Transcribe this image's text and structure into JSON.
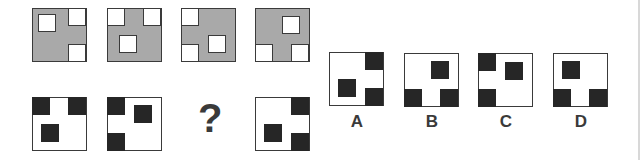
{
  "puzzle": {
    "question_mark": "?",
    "colors": {
      "gray_fill": "#a9a9a9",
      "black_square": "#262626",
      "outline": "#3a3a3a"
    },
    "row1": [
      {
        "left": 32,
        "top": 8,
        "squares": [
          [
            6,
            6
          ],
          [
            36,
            0
          ],
          [
            36,
            36
          ]
        ]
      },
      {
        "left": 107,
        "top": 8,
        "squares": [
          [
            0,
            0
          ],
          [
            36,
            0
          ],
          [
            12,
            27
          ]
        ]
      },
      {
        "left": 181,
        "top": 8,
        "squares": [
          [
            0,
            0
          ],
          [
            0,
            36
          ],
          [
            27,
            27
          ]
        ]
      },
      {
        "left": 255,
        "top": 8,
        "squares": [
          [
            0,
            36
          ],
          [
            36,
            36
          ],
          [
            27,
            8
          ]
        ]
      }
    ],
    "row2": [
      {
        "left": 32,
        "top": 97,
        "squares": [
          [
            0,
            0
          ],
          [
            36,
            0
          ],
          [
            9,
            27
          ]
        ]
      },
      {
        "left": 107,
        "top": 97,
        "squares": [
          [
            0,
            0
          ],
          [
            0,
            36
          ],
          [
            27,
            8
          ]
        ]
      },
      {
        "left": 255,
        "top": 97,
        "squares": [
          [
            36,
            0
          ],
          [
            36,
            36
          ],
          [
            9,
            27
          ]
        ]
      }
    ],
    "options": [
      {
        "label": "A",
        "left": 329,
        "top": 52,
        "squares": [
          [
            36,
            0
          ],
          [
            36,
            36
          ],
          [
            9,
            27
          ]
        ]
      },
      {
        "label": "B",
        "left": 404,
        "top": 53,
        "squares": [
          [
            0,
            36
          ],
          [
            36,
            36
          ],
          [
            27,
            8
          ]
        ]
      },
      {
        "label": "C",
        "left": 478,
        "top": 53,
        "squares": [
          [
            0,
            0
          ],
          [
            0,
            36
          ],
          [
            27,
            9
          ]
        ]
      },
      {
        "label": "D",
        "left": 553,
        "top": 53,
        "squares": [
          [
            0,
            36
          ],
          [
            36,
            36
          ],
          [
            9,
            8
          ]
        ]
      }
    ]
  }
}
